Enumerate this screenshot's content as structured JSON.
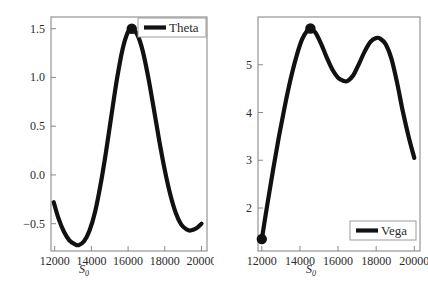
{
  "figure": {
    "background": "#ffffff",
    "line_color": "#111111",
    "frame_color": "#8a8a8a",
    "tick_color": "#8a8a8a",
    "marker_color": "#111111"
  },
  "panels": [
    {
      "id": "theta-panel",
      "legend_label": "Theta",
      "legend_position": "top-right",
      "xlabel": "S",
      "xlabel_sub": "0",
      "xticks": [
        "12000",
        "14000",
        "16000",
        "18000",
        "20000"
      ],
      "yticks": [
        "-0.5",
        "0.0",
        "0.5",
        "1.0",
        "1.5"
      ]
    },
    {
      "id": "vega-panel",
      "legend_label": "Vega",
      "legend_position": "bottom-right",
      "xlabel": "S",
      "xlabel_sub": "0",
      "xticks": [
        "12000",
        "14000",
        "16000",
        "18000",
        "20000"
      ],
      "yticks": [
        "2",
        "3",
        "4",
        "5"
      ]
    }
  ],
  "chart_data": [
    {
      "type": "line",
      "title": "",
      "xlabel": "S_0",
      "ylabel": "",
      "legend": [
        "Theta"
      ],
      "legend_position": "top-right",
      "grid": false,
      "xlim": [
        11800,
        20300
      ],
      "ylim": [
        -0.78,
        1.62
      ],
      "xticks": [
        12000,
        14000,
        16000,
        18000,
        20000
      ],
      "yticks": [
        -0.5,
        0.0,
        0.5,
        1.0,
        1.5
      ],
      "series": [
        {
          "name": "Theta",
          "x": [
            11950,
            12200,
            12500,
            12800,
            13100,
            13300,
            13600,
            13900,
            14200,
            14500,
            14800,
            15100,
            15400,
            15700,
            16000,
            16200,
            16500,
            16800,
            17100,
            17400,
            17700,
            18000,
            18300,
            18600,
            18900,
            19200,
            19400,
            19700,
            20000
          ],
          "y": [
            -0.28,
            -0.44,
            -0.58,
            -0.67,
            -0.71,
            -0.72,
            -0.68,
            -0.57,
            -0.38,
            -0.1,
            0.24,
            0.62,
            0.99,
            1.29,
            1.47,
            1.5,
            1.44,
            1.27,
            1.0,
            0.68,
            0.35,
            0.05,
            -0.2,
            -0.39,
            -0.51,
            -0.56,
            -0.57,
            -0.55,
            -0.5
          ]
        }
      ],
      "markers": [
        {
          "x": 16200,
          "y": 1.5,
          "label": "maximum"
        }
      ]
    },
    {
      "type": "line",
      "title": "",
      "xlabel": "S_0",
      "ylabel": "",
      "legend": [
        "Vega"
      ],
      "legend_position": "bottom-right",
      "grid": false,
      "xlim": [
        11800,
        20300
      ],
      "ylim": [
        1.1,
        6.0
      ],
      "xticks": [
        12000,
        14000,
        16000,
        18000,
        20000
      ],
      "yticks": [
        2,
        3,
        4,
        5
      ],
      "series": [
        {
          "name": "Vega",
          "x": [
            12000,
            12300,
            12600,
            12900,
            13200,
            13500,
            13800,
            14100,
            14400,
            14550,
            14800,
            15100,
            15400,
            15700,
            16000,
            16300,
            16500,
            16800,
            17100,
            17400,
            17700,
            18000,
            18200,
            18500,
            18800,
            19100,
            19400,
            19700,
            20000
          ],
          "y": [
            1.35,
            2.1,
            2.82,
            3.5,
            4.12,
            4.68,
            5.15,
            5.52,
            5.73,
            5.76,
            5.68,
            5.45,
            5.16,
            4.9,
            4.73,
            4.66,
            4.66,
            4.78,
            5.02,
            5.28,
            5.48,
            5.56,
            5.55,
            5.43,
            5.13,
            4.62,
            4.02,
            3.5,
            3.05
          ]
        }
      ],
      "markers": [
        {
          "x": 14550,
          "y": 5.76,
          "label": "maximum"
        },
        {
          "x": 12000,
          "y": 1.35,
          "label": "endpoint"
        }
      ]
    }
  ]
}
